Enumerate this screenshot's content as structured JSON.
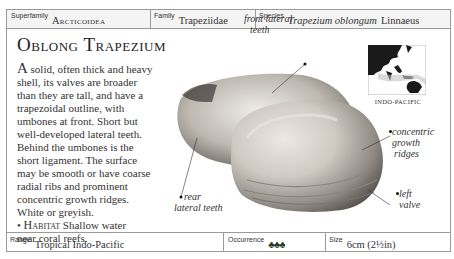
{
  "header": {
    "superfamily_label": "Superfamily",
    "superfamily_value": "Arcticoidea",
    "family_label": "Family",
    "family_value": "Trapeziidae",
    "species_label": "Species",
    "species_name": "Trapezium oblongum",
    "species_author": "Linnaeus"
  },
  "title": "Oblong Trapezium",
  "description": {
    "lines": [
      "A solid, often thick and heavy",
      "shell, its valves are broader",
      "than they are tall, and have a",
      "trapezoidal outline, with",
      "umbones at front. Short but",
      "well-developed lateral teeth.",
      "Behind the umbones is the",
      "short ligament. The surface",
      "may be smooth or have coarse",
      "radial ribs and prominent",
      "concentric growth ridges.",
      "White or greyish."
    ],
    "habitat_bullet": "•",
    "habitat_label": "Habitat",
    "habitat_text": "Shallow water",
    "habitat_text2": "near coral reefs."
  },
  "annotations": {
    "front_lateral_teeth_1": "front lateral",
    "front_lateral_teeth_2": "teeth",
    "rear_lateral_teeth_1": "rear",
    "rear_lateral_teeth_2": "lateral teeth",
    "concentric_1": "concentric",
    "concentric_2": "growth",
    "concentric_3": "ridges",
    "left_valve_1": "left",
    "left_valve_2": "valve"
  },
  "map": {
    "region_label": "INDO-PACIFIC"
  },
  "footer": {
    "range_label": "Range",
    "range_value": "Tropical Indo-Pacific",
    "occurrence_label": "Occurrence",
    "occurrence_icons": "♣♣♣",
    "size_label": "Size",
    "size_value": "6cm (2½in)"
  }
}
